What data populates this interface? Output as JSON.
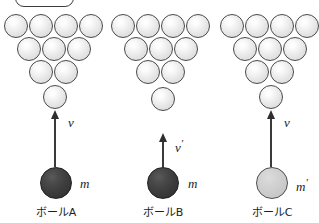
{
  "figure": {
    "width": 319,
    "height": 223,
    "background": "#ffffff",
    "top_box": {
      "x": 15,
      "y": -14,
      "w": 59,
      "h": 21
    },
    "pin_diameter": 24,
    "ball_diameter": 32,
    "colors": {
      "pin_outline": "#4a4a4a",
      "pin_fill": "#e8e8e8",
      "dark_ball": "#3d3d3d",
      "light_ball": "#d0d0d0",
      "arrow": "#2e2e2e",
      "text": "#1c1c1c"
    }
  },
  "groups": [
    {
      "id": "a",
      "caption": "ボールA",
      "caption_x": 56,
      "caption_y": 207,
      "pin_rows": [
        {
          "count": 4,
          "cx": [
            16,
            41,
            66,
            91
          ],
          "cy": 26
        },
        {
          "count": 3,
          "cx": [
            29,
            54,
            79
          ],
          "cy": 49
        },
        {
          "count": 2,
          "cx": [
            41,
            66
          ],
          "cy": 72
        }
      ],
      "lone_pin": {
        "cx": 55,
        "cy": 97
      },
      "arrow": {
        "x": 55,
        "y_top": 110,
        "y_bottom": 167
      },
      "velocity_label": "v",
      "velocity_prime": "",
      "velocity_x": 68,
      "velocity_y": 116,
      "ball": {
        "cx": 56,
        "cy": 183,
        "shade": "dark"
      },
      "mass_label": "m",
      "mass_prime": "",
      "mass_x": 80,
      "mass_y": 183
    },
    {
      "id": "b",
      "caption": "ボールB",
      "caption_x": 163,
      "caption_y": 207,
      "pin_rows": [
        {
          "count": 4,
          "cx": [
            123,
            148,
            173,
            198
          ],
          "cy": 26
        },
        {
          "count": 3,
          "cx": [
            136,
            161,
            186
          ],
          "cy": 49
        },
        {
          "count": 2,
          "cx": [
            148,
            173
          ],
          "cy": 72
        }
      ],
      "lone_pin": {
        "cx": 163,
        "cy": 99
      },
      "arrow": {
        "x": 163,
        "y_top": 133,
        "y_bottom": 167
      },
      "velocity_label": "v",
      "velocity_prime": "′",
      "velocity_x": 175,
      "velocity_y": 138,
      "ball": {
        "cx": 163,
        "cy": 183,
        "shade": "dark"
      },
      "mass_label": "m",
      "mass_prime": "",
      "mass_x": 188,
      "mass_y": 183
    },
    {
      "id": "c",
      "caption": "ボールC",
      "caption_x": 272,
      "caption_y": 207,
      "pin_rows": [
        {
          "count": 4,
          "cx": [
            232,
            257,
            282,
            307
          ],
          "cy": 26
        },
        {
          "count": 3,
          "cx": [
            245,
            270,
            295
          ],
          "cy": 49
        },
        {
          "count": 2,
          "cx": [
            257,
            282
          ],
          "cy": 72
        }
      ],
      "lone_pin": {
        "cx": 271,
        "cy": 97
      },
      "arrow": {
        "x": 271,
        "y_top": 110,
        "y_bottom": 167
      },
      "velocity_label": "v",
      "velocity_prime": "",
      "velocity_x": 284,
      "velocity_y": 116,
      "ball": {
        "cx": 272,
        "cy": 183,
        "shade": "light"
      },
      "mass_label": "m",
      "mass_prime": "′",
      "mass_x": 296,
      "mass_y": 183
    }
  ]
}
